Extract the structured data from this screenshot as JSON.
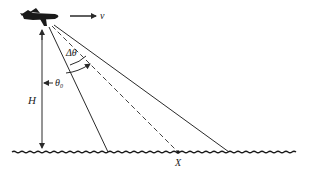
{
  "diagram": {
    "title": "",
    "labels": {
      "velocity": "v",
      "height": "H",
      "look_angle": "θ",
      "look_angle_sub": "0",
      "beam_width": "Δθ",
      "ground_point": "X"
    },
    "colors": {
      "stroke": "#2a2a2a",
      "background": "#ffffff"
    },
    "elements": [
      {
        "name": "aircraft",
        "type": "icon"
      },
      {
        "name": "velocity-arrow",
        "label": "v"
      },
      {
        "name": "height-arrow",
        "label": "H"
      },
      {
        "name": "near-beam-edge",
        "style": "solid"
      },
      {
        "name": "beam-center",
        "style": "dashed"
      },
      {
        "name": "far-beam-edge",
        "style": "solid"
      },
      {
        "name": "ground-surface",
        "style": "wavy"
      },
      {
        "name": "ground-point",
        "label": "X"
      }
    ]
  }
}
